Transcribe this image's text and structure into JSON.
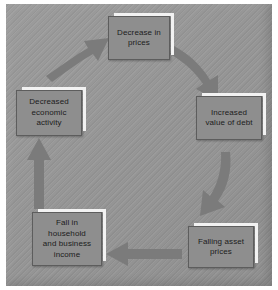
{
  "figure": {
    "kind": "cycle-diagram",
    "title": "",
    "background_color": "#969696",
    "box_fill_color": "#8e8e8e",
    "box_highlight_color": "#f2f2f2",
    "arrow_color": "#7b7b7b",
    "text_color": "#1c1c1c"
  },
  "nodes": [
    {
      "id": "decrease-in-prices",
      "label": "Decrease in\nprices",
      "position": "top"
    },
    {
      "id": "increased-value-of-debt",
      "label": "Increased\nvalue of debt",
      "position": "right"
    },
    {
      "id": "falling-asset-prices",
      "label": "Falling asset\nprices",
      "position": "bottom-right"
    },
    {
      "id": "fall-in-income",
      "label": "Fall in\nhousehold\nand business\nincome",
      "position": "bottom-left"
    },
    {
      "id": "decreased-economic-activity",
      "label": "Decreased\neconomic\nactivity",
      "position": "left"
    }
  ],
  "arrows": [
    {
      "id": "arrow-top-to-right",
      "from": "decrease-in-prices",
      "to": "increased-value-of-debt",
      "style": "curved",
      "direction": "down-right"
    },
    {
      "id": "arrow-right-to-bottomright",
      "from": "increased-value-of-debt",
      "to": "falling-asset-prices",
      "style": "curved",
      "direction": "down-left"
    },
    {
      "id": "arrow-bottomright-to-bottomleft",
      "from": "falling-asset-prices",
      "to": "fall-in-income",
      "style": "straight",
      "direction": "left"
    },
    {
      "id": "arrow-bottomleft-to-left",
      "from": "fall-in-income",
      "to": "decreased-economic-activity",
      "style": "straight",
      "direction": "up"
    },
    {
      "id": "arrow-left-to-top",
      "from": "decreased-economic-activity",
      "to": "decrease-in-prices",
      "style": "straight",
      "direction": "up-right"
    }
  ]
}
